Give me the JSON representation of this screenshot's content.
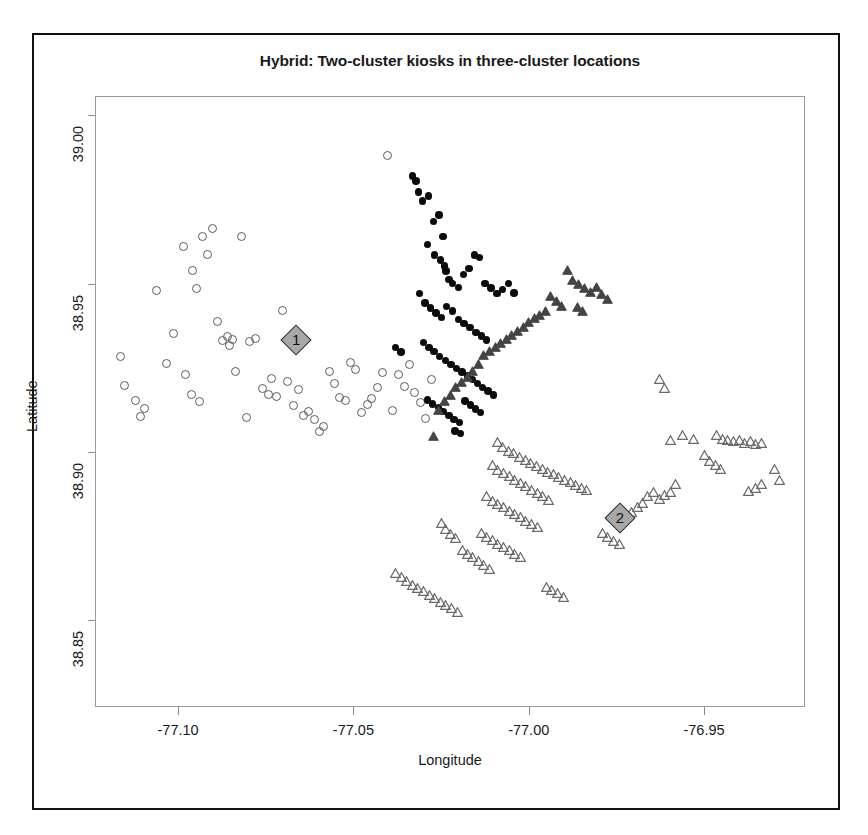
{
  "chart_data": {
    "type": "scatter",
    "title": "Hybrid: Two-cluster kiosks in three-cluster locations",
    "xlabel": "Longitude",
    "ylabel": "Latitude",
    "xlim": [
      -77.1237,
      -76.9212
    ],
    "ylim": [
      38.8243,
      39.0057
    ],
    "xticks": [
      -77.1,
      -77.05,
      -77.0,
      -76.95
    ],
    "xtick_labels": [
      "-77.10",
      "-77.05",
      "-77.00",
      "-76.95"
    ],
    "yticks": [
      38.85,
      38.9,
      38.95,
      39.0
    ],
    "ytick_labels": [
      "38.85",
      "38.90",
      "38.95",
      "39.00"
    ],
    "grid": false,
    "legend": "none",
    "series": [
      {
        "name": "locations-cluster-open-circle",
        "marker": "open-circle",
        "color": "#5c5c5c",
        "points": [
          [
            -77.1153,
            38.9197
          ],
          [
            -77.1121,
            38.9153
          ],
          [
            -77.1108,
            38.9106
          ],
          [
            -77.1096,
            38.9131
          ],
          [
            -77.1062,
            38.9479
          ],
          [
            -77.1034,
            38.9265
          ],
          [
            -77.1013,
            38.9352
          ],
          [
            -77.0986,
            38.9612
          ],
          [
            -77.0961,
            38.954
          ],
          [
            -77.0947,
            38.9487
          ],
          [
            -77.0931,
            38.964
          ],
          [
            -77.0918,
            38.9586
          ],
          [
            -77.0903,
            38.9665
          ],
          [
            -77.0889,
            38.9389
          ],
          [
            -77.0873,
            38.9331
          ],
          [
            -77.086,
            38.9344
          ],
          [
            -77.0853,
            38.9318
          ],
          [
            -77.0846,
            38.9336
          ],
          [
            -77.082,
            38.9641
          ],
          [
            -77.0796,
            38.933
          ],
          [
            -77.0779,
            38.9337
          ],
          [
            -77.076,
            38.9189
          ],
          [
            -77.0744,
            38.9172
          ],
          [
            -77.0735,
            38.9219
          ],
          [
            -77.0721,
            38.9165
          ],
          [
            -77.0704,
            38.9421
          ],
          [
            -77.0688,
            38.9209
          ],
          [
            -77.0672,
            38.9139
          ],
          [
            -77.0657,
            38.9187
          ],
          [
            -77.0643,
            38.9108
          ],
          [
            -77.063,
            38.9121
          ],
          [
            -77.0612,
            38.9096
          ],
          [
            -77.0598,
            38.9063
          ],
          [
            -77.0585,
            38.9078
          ],
          [
            -77.057,
            38.924
          ],
          [
            -77.0556,
            38.9205
          ],
          [
            -77.054,
            38.9163
          ],
          [
            -77.0524,
            38.9153
          ],
          [
            -77.0508,
            38.9268
          ],
          [
            -77.0496,
            38.9245
          ],
          [
            -77.0478,
            38.9119
          ],
          [
            -77.0462,
            38.9143
          ],
          [
            -77.0449,
            38.9159
          ],
          [
            -77.0433,
            38.9193
          ],
          [
            -77.0418,
            38.9238
          ],
          [
            -77.0404,
            38.9881
          ],
          [
            -77.0388,
            38.9124
          ],
          [
            -77.0372,
            38.923
          ],
          [
            -77.0356,
            38.9196
          ],
          [
            -77.0341,
            38.9261
          ],
          [
            -77.0327,
            38.9177
          ],
          [
            -77.031,
            38.9147
          ],
          [
            -77.0295,
            38.91
          ],
          [
            -77.0278,
            38.9215
          ],
          [
            -77.1165,
            38.9284
          ],
          [
            -77.098,
            38.923
          ],
          [
            -77.0962,
            38.9172
          ],
          [
            -77.094,
            38.9152
          ],
          [
            -77.0838,
            38.924
          ],
          [
            -77.0806,
            38.9103
          ]
        ]
      },
      {
        "name": "kiosks-cluster-filled-circle",
        "marker": "filled-circle",
        "color": "#0b0b0b",
        "points": [
          [
            -77.0332,
            38.982
          ],
          [
            -77.0322,
            38.9805
          ],
          [
            -77.0314,
            38.9772
          ],
          [
            -77.0303,
            38.9745
          ],
          [
            -77.0286,
            38.976
          ],
          [
            -77.0272,
            38.9685
          ],
          [
            -77.0256,
            38.9704
          ],
          [
            -77.0244,
            38.964
          ],
          [
            -77.0289,
            38.9616
          ],
          [
            -77.0268,
            38.9585
          ],
          [
            -77.0251,
            38.957
          ],
          [
            -77.024,
            38.9552
          ],
          [
            -77.0236,
            38.9538
          ],
          [
            -77.0228,
            38.9512
          ],
          [
            -77.0218,
            38.95
          ],
          [
            -77.02,
            38.9488
          ],
          [
            -77.0186,
            38.9527
          ],
          [
            -77.017,
            38.9545
          ],
          [
            -77.0155,
            38.9585
          ],
          [
            -77.014,
            38.9577
          ],
          [
            -77.0124,
            38.95
          ],
          [
            -77.0108,
            38.9487
          ],
          [
            -77.009,
            38.947
          ],
          [
            -77.0075,
            38.9482
          ],
          [
            -77.0058,
            38.95
          ],
          [
            -77.0042,
            38.9472
          ],
          [
            -77.0312,
            38.947
          ],
          [
            -77.0296,
            38.9442
          ],
          [
            -77.028,
            38.9428
          ],
          [
            -77.0264,
            38.9413
          ],
          [
            -77.0249,
            38.94
          ],
          [
            -77.0234,
            38.9432
          ],
          [
            -77.0218,
            38.9418
          ],
          [
            -77.02,
            38.9393
          ],
          [
            -77.0184,
            38.9381
          ],
          [
            -77.0168,
            38.9369
          ],
          [
            -77.015,
            38.9355
          ],
          [
            -77.0134,
            38.9344
          ],
          [
            -77.012,
            38.9332
          ],
          [
            -77.03,
            38.9325
          ],
          [
            -77.0285,
            38.931
          ],
          [
            -77.027,
            38.9298
          ],
          [
            -77.0254,
            38.9283
          ],
          [
            -77.0238,
            38.9272
          ],
          [
            -77.0222,
            38.926
          ],
          [
            -77.0206,
            38.9248
          ],
          [
            -77.019,
            38.9238
          ],
          [
            -77.0175,
            38.9226
          ],
          [
            -77.016,
            38.9215
          ],
          [
            -77.0146,
            38.9203
          ],
          [
            -77.0132,
            38.9192
          ],
          [
            -77.0116,
            38.9181
          ],
          [
            -77.01,
            38.917
          ],
          [
            -77.0288,
            38.9155
          ],
          [
            -77.0274,
            38.9143
          ],
          [
            -77.0258,
            38.9132
          ],
          [
            -77.0244,
            38.912
          ],
          [
            -77.0228,
            38.9108
          ],
          [
            -77.0213,
            38.9097
          ],
          [
            -77.0198,
            38.9088
          ],
          [
            -77.0182,
            38.9152
          ],
          [
            -77.0166,
            38.914
          ],
          [
            -77.0152,
            38.9128
          ],
          [
            -77.0138,
            38.9118
          ],
          [
            -77.021,
            38.9062
          ],
          [
            -77.0194,
            38.9055
          ],
          [
            -77.038,
            38.931
          ],
          [
            -77.0364,
            38.9297
          ]
        ]
      },
      {
        "name": "locations-cluster-filled-triangle",
        "marker": "filled-triangle",
        "color": "#444444",
        "points": [
          [
            -76.989,
            38.954
          ],
          [
            -76.9874,
            38.9512
          ],
          [
            -76.9858,
            38.95
          ],
          [
            -76.984,
            38.9487
          ],
          [
            -76.9824,
            38.9476
          ],
          [
            -76.9808,
            38.949
          ],
          [
            -76.9792,
            38.947
          ],
          [
            -76.9776,
            38.9455
          ],
          [
            -76.9938,
            38.9462
          ],
          [
            -76.9922,
            38.9448
          ],
          [
            -76.9906,
            38.9435
          ],
          [
            -76.9952,
            38.942
          ],
          [
            -76.9968,
            38.9408
          ],
          [
            -76.9984,
            38.9398
          ],
          [
            -77.0,
            38.9386
          ],
          [
            -77.0016,
            38.9372
          ],
          [
            -77.0032,
            38.936
          ],
          [
            -77.0048,
            38.9348
          ],
          [
            -77.0064,
            38.9336
          ],
          [
            -77.008,
            38.9324
          ],
          [
            -77.0096,
            38.9312
          ],
          [
            -77.0112,
            38.93
          ],
          [
            -77.0128,
            38.9288
          ],
          [
            -77.0144,
            38.9262
          ],
          [
            -77.016,
            38.924
          ],
          [
            -77.0176,
            38.9224
          ],
          [
            -77.0192,
            38.9208
          ],
          [
            -77.0208,
            38.9192
          ],
          [
            -77.0224,
            38.917
          ],
          [
            -77.024,
            38.9152
          ],
          [
            -77.0256,
            38.9125
          ],
          [
            -77.0272,
            38.9048
          ],
          [
            -76.9862,
            38.943
          ],
          [
            -76.9846,
            38.942
          ]
        ]
      },
      {
        "name": "locations-cluster-open-triangle",
        "marker": "open-triangle",
        "color": "#6a6a6a",
        "points": [
          [
            -76.9628,
            38.9218
          ],
          [
            -76.9612,
            38.919
          ],
          [
            -76.9464,
            38.9052
          ],
          [
            -76.9448,
            38.904
          ],
          [
            -76.9432,
            38.9036
          ],
          [
            -76.9416,
            38.9032
          ],
          [
            -76.94,
            38.9036
          ],
          [
            -76.9384,
            38.9028
          ],
          [
            -76.9368,
            38.9032
          ],
          [
            -76.9352,
            38.9024
          ],
          [
            -76.9336,
            38.9028
          ],
          [
            -76.953,
            38.904
          ],
          [
            -76.956,
            38.9052
          ],
          [
            -76.9596,
            38.9036
          ],
          [
            -76.95,
            38.899
          ],
          [
            -76.9484,
            38.8972
          ],
          [
            -76.9468,
            38.896
          ],
          [
            -76.9452,
            38.895
          ],
          [
            -76.93,
            38.895
          ],
          [
            -76.9284,
            38.8918
          ],
          [
            -76.9336,
            38.8906
          ],
          [
            -76.9352,
            38.8894
          ],
          [
            -76.9374,
            38.8884
          ],
          [
            -76.958,
            38.8906
          ],
          [
            -76.9596,
            38.888
          ],
          [
            -76.9612,
            38.8872
          ],
          [
            -76.9628,
            38.8862
          ],
          [
            -76.9644,
            38.8882
          ],
          [
            -76.966,
            38.887
          ],
          [
            -76.9676,
            38.885
          ],
          [
            -76.969,
            38.8838
          ],
          [
            -76.9706,
            38.8822
          ],
          [
            -77.009,
            38.903
          ],
          [
            -77.0074,
            38.9016
          ],
          [
            -77.0058,
            38.9004
          ],
          [
            -77.0042,
            38.8996
          ],
          [
            -77.0026,
            38.8984
          ],
          [
            -77.001,
            38.8976
          ],
          [
            -76.9994,
            38.8968
          ],
          [
            -76.9978,
            38.8958
          ],
          [
            -76.9962,
            38.895
          ],
          [
            -76.9946,
            38.8942
          ],
          [
            -76.993,
            38.8934
          ],
          [
            -76.9914,
            38.8926
          ],
          [
            -76.9898,
            38.8918
          ],
          [
            -76.9882,
            38.891
          ],
          [
            -76.9866,
            38.8902
          ],
          [
            -76.985,
            38.8894
          ],
          [
            -76.9834,
            38.8886
          ],
          [
            -77.0104,
            38.896
          ],
          [
            -77.0088,
            38.8948
          ],
          [
            -77.0072,
            38.8938
          ],
          [
            -77.0056,
            38.8928
          ],
          [
            -77.004,
            38.8918
          ],
          [
            -77.0024,
            38.8908
          ],
          [
            -77.0008,
            38.8898
          ],
          [
            -76.9992,
            38.8888
          ],
          [
            -76.9976,
            38.8878
          ],
          [
            -76.996,
            38.8868
          ],
          [
            -76.9944,
            38.8858
          ],
          [
            -77.012,
            38.8868
          ],
          [
            -77.0104,
            38.8856
          ],
          [
            -77.0088,
            38.8846
          ],
          [
            -77.0072,
            38.8836
          ],
          [
            -77.0056,
            38.8826
          ],
          [
            -77.004,
            38.8816
          ],
          [
            -77.0024,
            38.8806
          ],
          [
            -77.0008,
            38.8796
          ],
          [
            -76.9992,
            38.8786
          ],
          [
            -76.9976,
            38.8776
          ],
          [
            -77.0136,
            38.876
          ],
          [
            -77.012,
            38.8748
          ],
          [
            -77.0104,
            38.8738
          ],
          [
            -77.0088,
            38.8728
          ],
          [
            -77.0072,
            38.8718
          ],
          [
            -77.0056,
            38.8708
          ],
          [
            -77.004,
            38.8698
          ],
          [
            -77.0024,
            38.8688
          ],
          [
            -77.019,
            38.871
          ],
          [
            -77.0176,
            38.8698
          ],
          [
            -77.016,
            38.8688
          ],
          [
            -77.0144,
            38.8676
          ],
          [
            -77.0128,
            38.8664
          ],
          [
            -77.0112,
            38.8654
          ],
          [
            -77.025,
            38.879
          ],
          [
            -77.0236,
            38.877
          ],
          [
            -77.0222,
            38.8756
          ],
          [
            -77.0208,
            38.8744
          ],
          [
            -76.979,
            38.876
          ],
          [
            -76.9774,
            38.8748
          ],
          [
            -76.9758,
            38.8736
          ],
          [
            -76.9742,
            38.8726
          ],
          [
            -77.038,
            38.864
          ],
          [
            -77.0364,
            38.8628
          ],
          [
            -77.0348,
            38.8616
          ],
          [
            -77.0332,
            38.8606
          ],
          [
            -77.0316,
            38.8596
          ],
          [
            -77.03,
            38.8586
          ],
          [
            -77.0284,
            38.8576
          ],
          [
            -77.0268,
            38.8566
          ],
          [
            -77.0252,
            38.8556
          ],
          [
            -77.0236,
            38.8546
          ],
          [
            -77.022,
            38.8536
          ],
          [
            -77.0204,
            38.8526
          ],
          [
            -76.995,
            38.86
          ],
          [
            -76.9934,
            38.859
          ],
          [
            -76.9918,
            38.858
          ],
          [
            -76.9902,
            38.857
          ]
        ]
      }
    ],
    "centroids": [
      {
        "label": "1",
        "x": -77.0663,
        "y": 38.9333,
        "marker": "gray-diamond"
      },
      {
        "label": "2",
        "x": -76.974,
        "y": 38.8805,
        "marker": "gray-diamond"
      }
    ]
  }
}
